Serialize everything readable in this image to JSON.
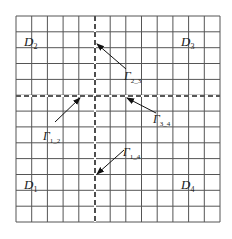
{
  "diagram": {
    "title": "",
    "grid": {
      "left": 16,
      "top": 16,
      "right": 220,
      "bottom": 222,
      "cols": 13,
      "rows": 13,
      "line_color": "#555555",
      "dash_color": "#222222",
      "vertical_divider_x": 95,
      "horizontal_divider_y": 96
    },
    "domains": [
      {
        "id": "D1",
        "letter": "D",
        "sub": "1",
        "x": 36,
        "y": 189
      },
      {
        "id": "D2",
        "letter": "D",
        "sub": "2",
        "x": 36,
        "y": 46
      },
      {
        "id": "D3",
        "letter": "D",
        "sub": "3",
        "x": 193,
        "y": 46
      },
      {
        "id": "D4",
        "letter": "D",
        "sub": "4",
        "x": 193,
        "y": 189
      }
    ],
    "interfaces": [
      {
        "id": "Gamma_2_3",
        "letter": "Γ",
        "sub": "2_3",
        "label_x": 128,
        "label_y": 80,
        "arrow_from": [
          126,
          69
        ],
        "arrow_to": [
          97,
          44
        ]
      },
      {
        "id": "Gamma_3_4",
        "letter": "Γ",
        "sub": "3_4",
        "label_x": 157,
        "label_y": 123,
        "arrow_from": [
          156,
          113
        ],
        "arrow_to": [
          127,
          98
        ]
      },
      {
        "id": "Gamma_1_2",
        "letter": "Γ",
        "sub": "1_2",
        "label_x": 47,
        "label_y": 140,
        "arrow_from": [
          55,
          122
        ],
        "arrow_to": [
          80,
          98
        ]
      },
      {
        "id": "Gamma_1_4",
        "letter": "Γ",
        "sub": "1_4",
        "label_x": 127,
        "label_y": 156,
        "arrow_from": [
          124,
          150
        ],
        "arrow_to": [
          97,
          174
        ]
      }
    ]
  }
}
